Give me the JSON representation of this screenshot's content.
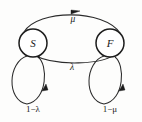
{
  "diagram": {
    "type": "markov-state-transition-diagram",
    "background_color": "#fdfdfc",
    "stroke_color": "#2b2b2b",
    "nodes": [
      {
        "id": "S",
        "label": "S",
        "cx": 33,
        "cy": 43,
        "r": 14
      },
      {
        "id": "F",
        "label": "F",
        "cx": 110,
        "cy": 43,
        "r": 14
      }
    ],
    "edges": [
      {
        "id": "s-to-f",
        "from": "S",
        "to": "F",
        "label": "μ",
        "label_x": 73,
        "label_y": 20,
        "direction": "right"
      },
      {
        "id": "f-to-s",
        "from": "F",
        "to": "S",
        "label": "λ",
        "label_x": 72,
        "label_y": 68,
        "direction": "left"
      }
    ],
    "self_loops": [
      {
        "id": "s-self-loop",
        "node": "S",
        "label": "1−λ",
        "label_x": 33,
        "label_y": 109
      },
      {
        "id": "f-self-loop",
        "node": "F",
        "label": "1−μ",
        "label_x": 110,
        "label_y": 109
      }
    ]
  }
}
